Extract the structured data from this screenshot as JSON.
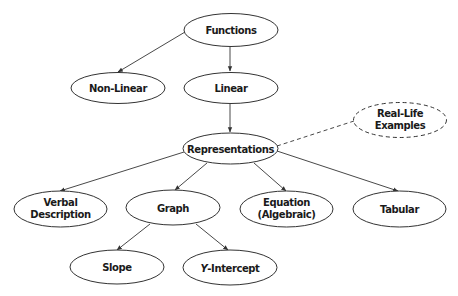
{
  "diagram": {
    "type": "concept-map",
    "nodes": {
      "functions": {
        "label": "Functions"
      },
      "non_linear": {
        "label": "Non-Linear"
      },
      "linear": {
        "label": "Linear"
      },
      "representations": {
        "label": "Representations"
      },
      "real_life": {
        "line1": "Real-Life",
        "line2": "Examples",
        "style": "dashed"
      },
      "verbal": {
        "line1": "Verbal",
        "line2": "Description"
      },
      "graph": {
        "label": "Graph"
      },
      "equation": {
        "line1": "Equation",
        "line2": "(Algebraic)"
      },
      "tabular": {
        "label": "Tabular"
      },
      "slope": {
        "label": "Slope"
      },
      "y_intercept": {
        "prefix": "Y",
        "label": "-Intercept"
      }
    },
    "edges": [
      {
        "from": "Functions",
        "to": "Non-Linear",
        "style": "arrow"
      },
      {
        "from": "Functions",
        "to": "Linear",
        "style": "arrow"
      },
      {
        "from": "Linear",
        "to": "Representations",
        "style": "arrow"
      },
      {
        "from": "Representations",
        "to": "Real-Life Examples",
        "style": "dashed"
      },
      {
        "from": "Representations",
        "to": "Verbal Description",
        "style": "arrow"
      },
      {
        "from": "Representations",
        "to": "Graph",
        "style": "arrow"
      },
      {
        "from": "Representations",
        "to": "Equation (Algebraic)",
        "style": "arrow"
      },
      {
        "from": "Representations",
        "to": "Tabular",
        "style": "arrow"
      },
      {
        "from": "Graph",
        "to": "Slope",
        "style": "arrow"
      },
      {
        "from": "Graph",
        "to": "Y-Intercept",
        "style": "arrow"
      }
    ],
    "colors": {
      "stroke": "#333333",
      "text": "#1a1a1a",
      "background": "#ffffff"
    }
  }
}
